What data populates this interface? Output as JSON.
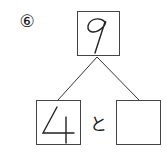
{
  "problem_number": "⑥",
  "whole": "9",
  "part_left": "4",
  "part_right": "",
  "connector": "と"
}
